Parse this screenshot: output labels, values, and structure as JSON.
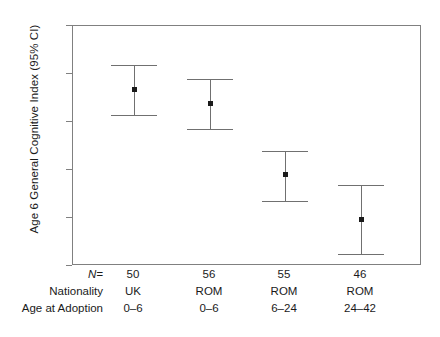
{
  "chart_data": {
    "type": "scatter",
    "title": "",
    "xlabel": "",
    "ylabel": "Age 6 General Cognitive Index (95% CI)",
    "ylim": [
      80,
      130
    ],
    "yticks": [
      80,
      90,
      100,
      110,
      120,
      130
    ],
    "ytick_labels": [
      "80",
      "90",
      "100",
      "110",
      "120",
      "130"
    ],
    "grid": false,
    "legend": "none",
    "categories": [
      "UK 0–6",
      "ROM 0–6",
      "ROM 6–24",
      "ROM 24–42"
    ],
    "series": [
      {
        "name": "Age 6 General Cognitive Index",
        "values": [
          116.8,
          113.8,
          99.0,
          89.6
        ],
        "ci_lower": [
          111.4,
          108.6,
          93.5,
          82.6
        ],
        "ci_upper": [
          121.9,
          118.9,
          103.9,
          96.9
        ]
      }
    ],
    "row_labels": {
      "n_label": "N=",
      "nationality_label": "Nationality",
      "age_at_adoption_label": "Age at Adoption"
    },
    "columns": [
      {
        "n": "50",
        "nationality": "UK",
        "age_at_adoption": "0–6"
      },
      {
        "n": "56",
        "nationality": "ROM",
        "age_at_adoption": "0–6"
      },
      {
        "n": "55",
        "nationality": "ROM",
        "age_at_adoption": "6–24"
      },
      {
        "n": "46",
        "nationality": "ROM",
        "age_at_adoption": "24–42"
      }
    ],
    "colors": {
      "marker": "#1a1a1a",
      "errorbar": "#707070",
      "axis": "#808080",
      "background": "#ffffff",
      "text": "#1a1a1a"
    }
  }
}
